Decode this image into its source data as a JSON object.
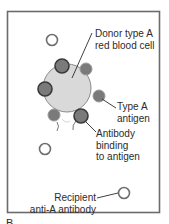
{
  "figure": {
    "panel_letter": "B",
    "colors": {
      "frame": "#6b6b6b",
      "cell_fill": "#d9d9d9",
      "cell_stroke": "#8a8a8a",
      "antigen_fill": "#7a7a7a",
      "antigen_ring": "#3a3a3a",
      "free_antibody_stroke": "#6e6e6e",
      "leader_line": "#2b2b2b",
      "text": "#2b2b2b"
    },
    "labels": {
      "donor_cell": [
        "Donor type A",
        "red blood cell"
      ],
      "type_a_antigen": [
        "Type A",
        "antigen"
      ],
      "antibody_binding": [
        "Antibody",
        "binding",
        "to antigen"
      ],
      "recipient_antibody": [
        "Recipient",
        "anti-A antibody"
      ]
    }
  }
}
